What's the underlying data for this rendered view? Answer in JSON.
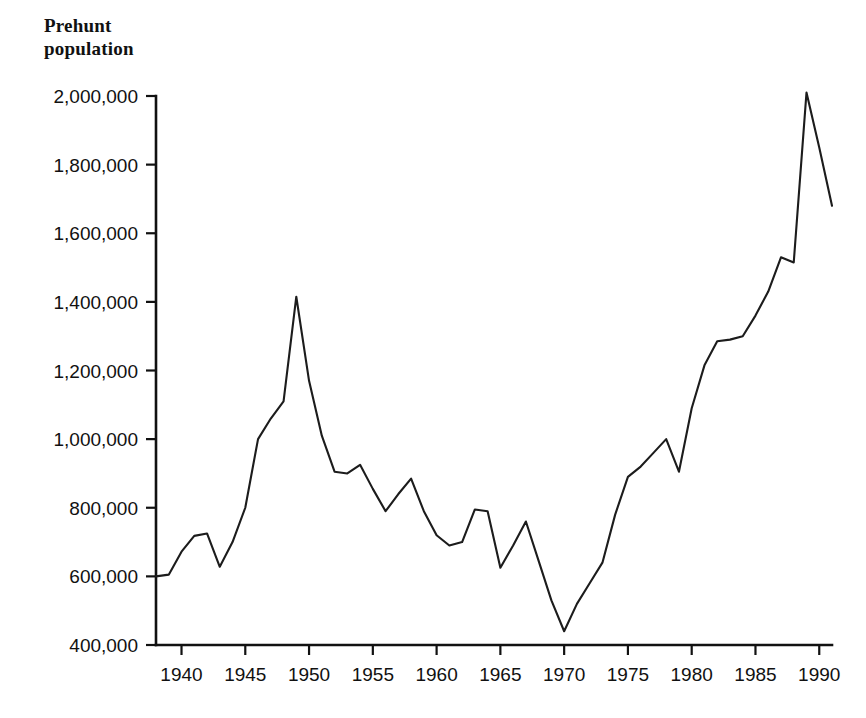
{
  "chart_data": {
    "type": "line",
    "title": "Prehunt\npopulation",
    "xlabel": "",
    "ylabel": "Prehunt population",
    "xlim": [
      1938,
      1991
    ],
    "ylim": [
      400000,
      2000000
    ],
    "grid": false,
    "legend": "none",
    "x_ticks": [
      1940,
      1945,
      1950,
      1955,
      1960,
      1965,
      1970,
      1975,
      1980,
      1985,
      1990
    ],
    "x_tick_labels": [
      "1940",
      "1945",
      "1950",
      "1955",
      "1960",
      "1965",
      "1970",
      "1975",
      "1980",
      "1985",
      "1990"
    ],
    "y_ticks": [
      400000,
      600000,
      800000,
      1000000,
      1200000,
      1400000,
      1600000,
      1800000,
      2000000
    ],
    "y_tick_labels": [
      "400,000",
      "600,000",
      "800,000",
      "1,000,000",
      "1,200,000",
      "1,400,000",
      "1,600,000",
      "1,800,000",
      "2,000,000"
    ],
    "series": [
      {
        "name": "Prehunt population",
        "color": "#1c1c1c",
        "x": [
          1938,
          1939,
          1940,
          1941,
          1942,
          1943,
          1944,
          1945,
          1946,
          1947,
          1948,
          1949,
          1950,
          1951,
          1952,
          1953,
          1954,
          1955,
          1956,
          1957,
          1958,
          1959,
          1960,
          1961,
          1962,
          1963,
          1964,
          1965,
          1966,
          1967,
          1968,
          1969,
          1970,
          1971,
          1972,
          1973,
          1974,
          1975,
          1976,
          1977,
          1978,
          1979,
          1980,
          1981,
          1982,
          1983,
          1984,
          1985,
          1986,
          1987,
          1988,
          1989,
          1990,
          1991
        ],
        "y": [
          600000,
          605000,
          672000,
          718000,
          725000,
          628000,
          700000,
          800000,
          1000000,
          1060000,
          1110000,
          1415000,
          1170000,
          1010000,
          905000,
          900000,
          925000,
          855000,
          790000,
          840000,
          885000,
          790000,
          720000,
          690000,
          700000,
          795000,
          790000,
          625000,
          690000,
          760000,
          645000,
          530000,
          440000,
          520000,
          580000,
          640000,
          780000,
          890000,
          920000,
          960000,
          1000000,
          905000,
          1090000,
          1215000,
          1285000,
          1290000,
          1300000,
          1360000,
          1430000,
          1530000,
          1515000,
          2010000,
          1850000,
          1680000
        ]
      }
    ]
  }
}
